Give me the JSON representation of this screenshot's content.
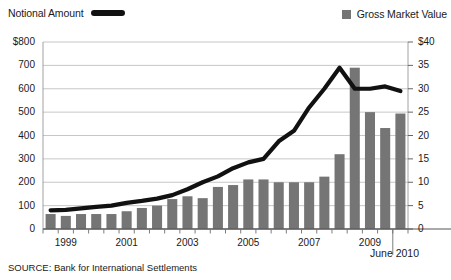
{
  "legend": {
    "left": {
      "label": "Notional Amount",
      "swatch_name": "line-swatch",
      "color": "#111111"
    },
    "right": {
      "label": "Gross Market Value",
      "swatch_name": "box-swatch",
      "color": "#757575"
    }
  },
  "source": "SOURCE: Bank for International Settlements",
  "end_label": "June 2010",
  "chart_data": {
    "type": "bar",
    "title": "",
    "subtitle": "",
    "xlabel": "",
    "ylabel": "",
    "y2label": "",
    "grid": true,
    "legend_position": "top",
    "ylim": [
      0,
      800
    ],
    "y2lim": [
      0,
      40
    ],
    "yticks": [
      0,
      100,
      200,
      300,
      400,
      500,
      600,
      700,
      800
    ],
    "ytick_labels": [
      "0",
      "100",
      "200",
      "300",
      "400",
      "500",
      "600",
      "700",
      "$800"
    ],
    "y2ticks": [
      0,
      5,
      10,
      15,
      20,
      25,
      30,
      35,
      40
    ],
    "y2tick_labels": [
      "0",
      "5",
      "10",
      "15",
      "20",
      "25",
      "30",
      "35",
      "$40"
    ],
    "xtick_labels": [
      "1999",
      "2001",
      "2003",
      "2005",
      "2007",
      "2009"
    ],
    "xtick_periods": [
      "1999H1",
      "2001H1",
      "2003H1",
      "2005H1",
      "2007H1",
      "2009H1"
    ],
    "x": [
      "1998H2",
      "1999H1",
      "1999H2",
      "2000H1",
      "2000H2",
      "2001H1",
      "2001H2",
      "2002H1",
      "2002H2",
      "2003H1",
      "2003H2",
      "2004H1",
      "2004H2",
      "2005H1",
      "2005H2",
      "2006H1",
      "2006H2",
      "2007H1",
      "2007H2",
      "2008H1",
      "2008H2",
      "2009H1",
      "2009H2",
      "2010H1"
    ],
    "series": [
      {
        "name": "Gross Market Value",
        "type": "bar",
        "axis": "right",
        "unit": "trillions USD",
        "color": "#757575",
        "values": [
          3.2,
          2.8,
          3.2,
          3.2,
          3.2,
          3.8,
          4.5,
          5.0,
          6.4,
          7.0,
          6.6,
          9.0,
          9.4,
          10.6,
          10.6,
          10.0,
          10.0,
          10.0,
          11.2,
          16.0,
          34.5,
          25.0,
          21.6,
          24.7
        ]
      },
      {
        "name": "Notional Amount",
        "type": "line",
        "axis": "left",
        "unit": "trillions USD",
        "color": "#111111",
        "values": [
          80,
          82,
          88,
          95,
          100,
          112,
          120,
          130,
          145,
          170,
          200,
          225,
          260,
          285,
          300,
          375,
          420,
          520,
          600,
          690,
          600,
          600,
          610,
          590
        ]
      }
    ]
  }
}
